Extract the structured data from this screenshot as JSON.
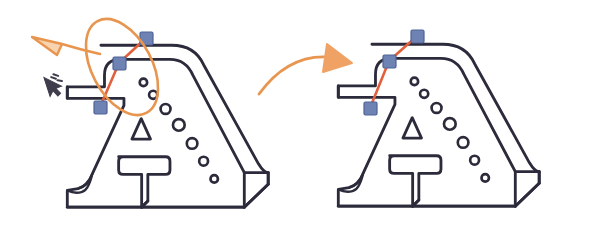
{
  "canvas": {
    "width": 604,
    "height": 247,
    "background": "#ffffff",
    "title": "CAD edit handle comparison"
  },
  "colors": {
    "outline": "#2b2b3c",
    "handle_fill": "#6f82b4",
    "handle_stroke": "#4f6296",
    "edit_line": "#e2603c",
    "annotation_orange": "#e8954f",
    "annotation_orange_fill": "#f0a265",
    "cursor_dark": "#3d3d4c"
  },
  "figures": [
    {
      "id": "before",
      "name": "left-figure-before",
      "label": "",
      "has_highlight_ellipse": true,
      "handles": [
        {
          "name": "handle-top",
          "x": 146,
          "y": 38
        },
        {
          "name": "handle-middle",
          "x": 119,
          "y": 63
        },
        {
          "name": "handle-lower-left",
          "x": 100,
          "y": 107
        }
      ]
    },
    {
      "id": "after",
      "name": "right-figure-after",
      "label": "",
      "has_highlight_ellipse": false,
      "handles": [
        {
          "name": "handle-top",
          "x": 417,
          "y": 36
        },
        {
          "name": "handle-middle",
          "x": 389,
          "y": 61
        },
        {
          "name": "handle-lower-left",
          "x": 370,
          "y": 108
        }
      ]
    }
  ],
  "annotations": {
    "highlight_ellipse": {
      "name": "selection-highlight-ellipse",
      "cx": 122,
      "cy": 67,
      "rx": 30,
      "ry": 52,
      "rotation": -28,
      "color": "#e8954f"
    },
    "leader_arrow": {
      "name": "leader-arrow-left",
      "direction": "left",
      "color": "#e8954f"
    },
    "transition_arrow": {
      "name": "transition-arrow-right",
      "direction": "right",
      "color": "#e8954f"
    },
    "cursor": {
      "name": "mouse-cursor-icon",
      "x": 44,
      "y": 80,
      "color": "#3d3d4c"
    }
  },
  "shape": {
    "name": "dam-profile-a-shape",
    "circle_count": 7,
    "circle_radii": [
      4.2,
      4.6,
      5.6,
      6.6,
      6.0,
      5.0,
      4.2
    ],
    "has_inner_triangle": true,
    "has_inner_tee": true
  }
}
